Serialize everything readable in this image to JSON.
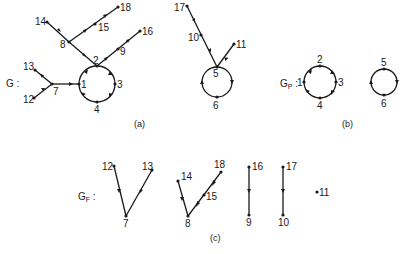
{
  "panels": {
    "a": {
      "caption": "(a)",
      "graph_label": "G :",
      "nodes": [
        "1",
        "2",
        "3",
        "4",
        "5",
        "6",
        "7",
        "8",
        "9",
        "10",
        "11",
        "12",
        "13",
        "14",
        "15",
        "16",
        "17",
        "18"
      ],
      "edges": [
        [
          "12",
          "7"
        ],
        [
          "13",
          "7"
        ],
        [
          "7",
          "1"
        ],
        [
          "14",
          "8"
        ],
        [
          "18",
          "15"
        ],
        [
          "15",
          "8"
        ],
        [
          "8",
          "2"
        ],
        [
          "16",
          "9"
        ],
        [
          "9",
          "2"
        ],
        [
          "1",
          "2"
        ],
        [
          "2",
          "3"
        ],
        [
          "3",
          "4"
        ],
        [
          "4",
          "1"
        ],
        [
          "17",
          "10"
        ],
        [
          "10",
          "5"
        ],
        [
          "11",
          "5"
        ],
        [
          "5",
          "6"
        ],
        [
          "6",
          "5"
        ]
      ]
    },
    "b": {
      "caption": "(b)",
      "graph_label": "G",
      "graph_label_sub": "P",
      "graph_label_suffix": " :",
      "cycles": [
        [
          "1",
          "2",
          "3",
          "4"
        ],
        [
          "5",
          "6"
        ]
      ]
    },
    "c": {
      "caption": "(c)",
      "graph_label": "G",
      "graph_label_sub": "F",
      "graph_label_suffix": " :",
      "trees": [
        {
          "root": "7",
          "edges": [
            [
              "12",
              "7"
            ],
            [
              "13",
              "7"
            ]
          ]
        },
        {
          "root": "8",
          "edges": [
            [
              "14",
              "8"
            ],
            [
              "18",
              "15"
            ],
            [
              "15",
              "8"
            ]
          ]
        },
        {
          "root": "9",
          "edges": [
            [
              "16",
              "9"
            ]
          ]
        },
        {
          "root": "10",
          "edges": [
            [
              "17",
              "10"
            ]
          ]
        },
        {
          "root": "11",
          "edges": []
        }
      ]
    }
  },
  "labels": {
    "n1": "1",
    "n2": "2",
    "n3": "3",
    "n4": "4",
    "n5": "5",
    "n6": "6",
    "n7": "7",
    "n8": "8",
    "n9": "9",
    "n10": "10",
    "n11": "11",
    "n12": "12",
    "n13": "13",
    "n14": "14",
    "n15": "15",
    "n16": "16",
    "n17": "17",
    "n18": "18"
  }
}
